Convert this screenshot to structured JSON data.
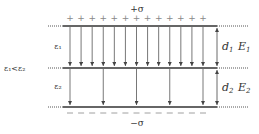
{
  "diagram": {
    "top_charge_label": "+σ",
    "bottom_charge_label": "−σ",
    "plus_sign": "+",
    "minus_sign": "−",
    "plus_count": 13,
    "minus_count": 13,
    "layer1": {
      "permittivity_label": "ε₁",
      "thickness_label": "d",
      "thickness_sub": "1",
      "field_label": "E",
      "field_sub": "1",
      "arrow_count": 13
    },
    "layer2": {
      "permittivity_label": "ε₂",
      "thickness_label": "d",
      "thickness_sub": "2",
      "field_label": "E",
      "field_sub": "2",
      "arrow_count": 5
    },
    "relation_label": "ε₁<ε₂",
    "colors": {
      "plate": "#333333",
      "arrow": "#555555",
      "dotted": "#555555",
      "charge": "#888888",
      "text": "#333333"
    }
  }
}
